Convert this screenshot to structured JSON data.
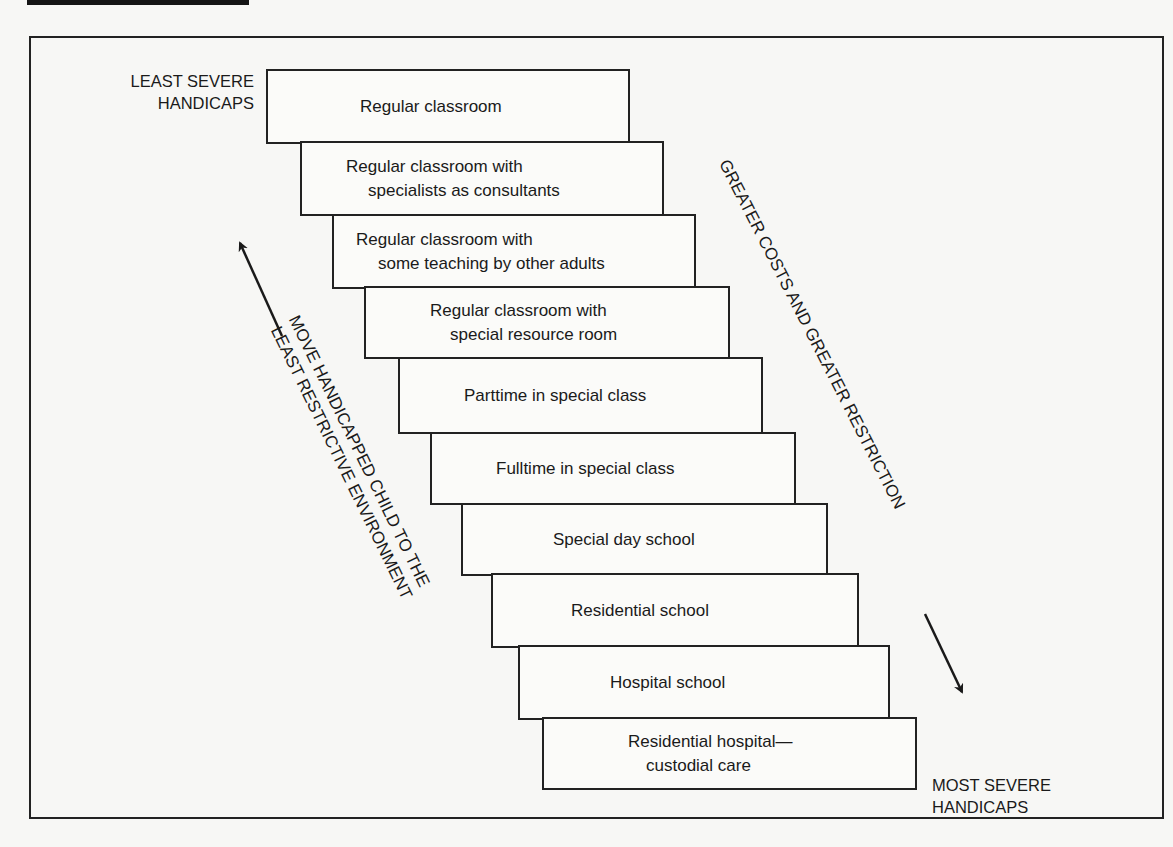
{
  "diagram": {
    "type": "cascade-of-services",
    "corner_labels": {
      "top_left": [
        "LEAST SEVERE",
        "HANDICAPS"
      ],
      "bottom_right": [
        "MOST SEVERE",
        "HANDICAPS"
      ]
    },
    "diagonal_labels": {
      "left": [
        "MOVE HANDICAPPED CHILD TO THE",
        "LEAST RESTRICTIVE ENVIRONMENT"
      ],
      "right": [
        "GREATER COSTS AND GREATER RESTRICTION"
      ]
    },
    "arrows": {
      "left": "up-left",
      "right": "down-right"
    },
    "steps": [
      {
        "line1": "Regular classroom",
        "line2": ""
      },
      {
        "line1": "Regular classroom with",
        "line2": "specialists as consultants"
      },
      {
        "line1": "Regular classroom with",
        "line2": "some teaching by other adults"
      },
      {
        "line1": "Regular classroom with",
        "line2": "special resource room"
      },
      {
        "line1": "Parttime in special class",
        "line2": ""
      },
      {
        "line1": "Fulltime in special class",
        "line2": ""
      },
      {
        "line1": "Special day school",
        "line2": ""
      },
      {
        "line1": "Residential school",
        "line2": ""
      },
      {
        "line1": "Hospital school",
        "line2": ""
      },
      {
        "line1": "Residential hospital—",
        "line2": "custodial care"
      }
    ]
  }
}
